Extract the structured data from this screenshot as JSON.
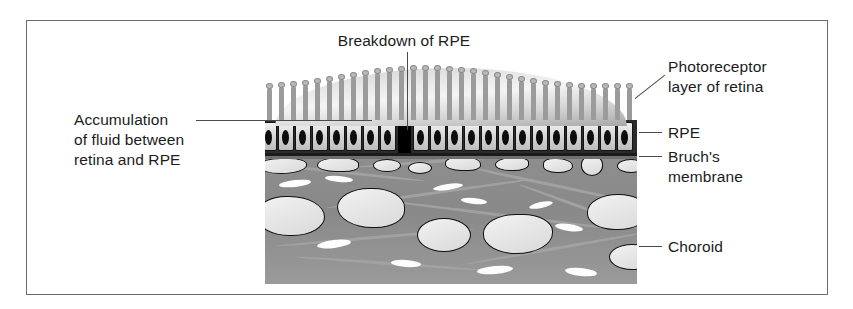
{
  "figure": {
    "domain_description": "Cross-sectional medical illustration of the retina showing breakdown of the retinal pigment epithelium with subretinal fluid accumulation",
    "border_color": "#6b6b6b",
    "background": "#ffffff"
  },
  "labels": {
    "top": {
      "name": "breakdown-of-rpe",
      "text": "Breakdown of RPE"
    },
    "left": {
      "name": "accumulation-of-fluid",
      "lines": [
        "Accumulation",
        "of fluid between",
        "retina and RPE"
      ]
    },
    "right": [
      {
        "name": "photoreceptor-layer",
        "lines": [
          "Photoreceptor",
          "layer of retina"
        ]
      },
      {
        "name": "rpe",
        "lines": [
          "RPE"
        ]
      },
      {
        "name": "bruchs-membrane",
        "lines": [
          "Bruch's",
          "membrane"
        ]
      },
      {
        "name": "choroid",
        "lines": [
          "Choroid"
        ]
      }
    ]
  },
  "illustration": {
    "layers": [
      {
        "name": "photoreceptor-layer",
        "color": "#9b9b9b"
      },
      {
        "name": "subretinal-fluid-dome",
        "color": "#e8e8e8"
      },
      {
        "name": "rpe-layer",
        "color": "#d6d6d6"
      },
      {
        "name": "breakdown-gap",
        "color": "#000000"
      },
      {
        "name": "bruchs-membrane",
        "color": "#1b1b1b"
      },
      {
        "name": "choroid-layer",
        "color": "#8e8e8e"
      }
    ],
    "rpe_cell_count": 26,
    "choroid_vessel_count": 22
  },
  "colors": {
    "ink": "#1c1c1c",
    "leader": "#4a4a4a",
    "frame": "#6b6b6b",
    "choroid": "#8e8e8e",
    "vessel_fill": "#f2f2f2"
  }
}
